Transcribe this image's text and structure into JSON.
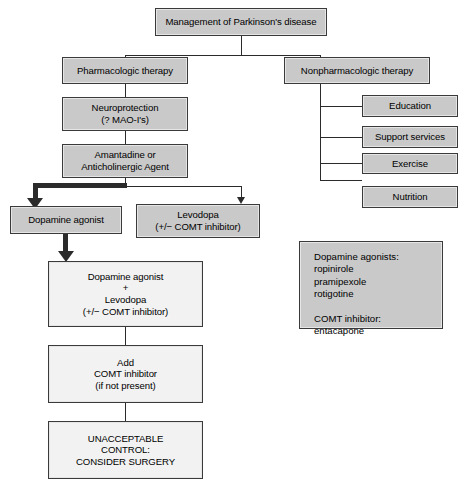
{
  "diagram": {
    "title": "Management of Parkinson's disease",
    "nodes": {
      "root": "Management of Parkinson's disease",
      "pharmacologic": "Pharmacologic therapy",
      "nonpharmacologic": "Nonpharmacologic therapy",
      "neuroprotection": "Neuroprotection\n(? MAO-I's)",
      "amantadine": "Amantadine or\nAnticholinergic Agent",
      "dopamine_agonist": "Dopamine agonist",
      "levodopa": "Levodopa\n(+/− COMT inhibitor)",
      "combination": "Dopamine agonist\n+\nLevodopa\n(+/− COMT inhibitor)",
      "add_comt": "Add\nCOMT inhibitor\n(if not present)",
      "surgery": "UNACCEPTABLE\nCONTROL:\nCONSIDER SURGERY"
    },
    "nonpharm_items": [
      "Education",
      "Support services",
      "Exercise",
      "Nutrition"
    ],
    "legend": "Dopamine agonists:\n  ropinirole\n  pramipexole\n  rotigotine\n\nCOMT inhibitor:\n  entacapone",
    "colors": {
      "box_fill_gray": "#c9c9c9",
      "box_fill_white": "#f2f2f2",
      "border": "#3a3a3a",
      "connector": "#2b2b2b"
    }
  }
}
